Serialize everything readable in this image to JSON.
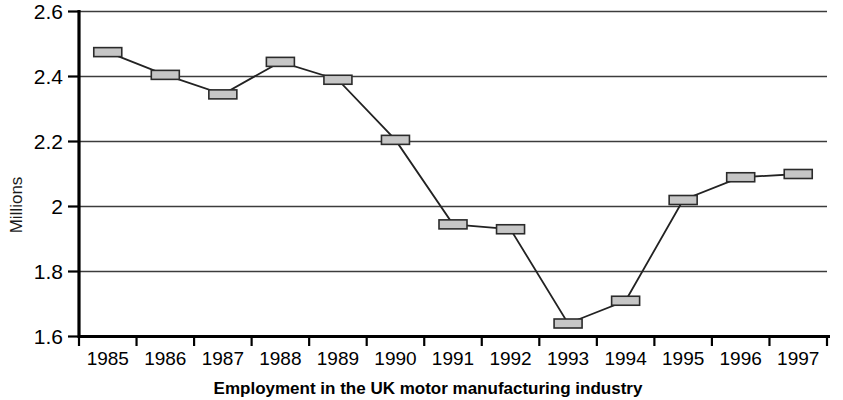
{
  "chart_data": {
    "type": "line",
    "title": "",
    "caption": "Employment in the UK motor manufacturing industry",
    "xlabel": "",
    "ylabel": "Millions",
    "categories": [
      "1985",
      "1986",
      "1987",
      "1988",
      "1989",
      "1990",
      "1991",
      "1992",
      "1993",
      "1994",
      "1995",
      "1996",
      "1997"
    ],
    "values": [
      2.475,
      2.405,
      2.345,
      2.445,
      2.39,
      2.205,
      1.945,
      1.93,
      1.64,
      1.71,
      2.02,
      2.09,
      2.1
    ],
    "series": [
      {
        "name": "Employment",
        "values": [
          2.475,
          2.405,
          2.345,
          2.445,
          2.39,
          2.205,
          1.945,
          1.93,
          1.64,
          1.71,
          2.02,
          2.09,
          2.1
        ]
      }
    ],
    "ylim": [
      1.6,
      2.6
    ],
    "ytick_labels": [
      "2.6",
      "2.4",
      "2.2",
      "2",
      "1.8",
      "1.6"
    ],
    "ytick_values": [
      2.6,
      2.4,
      2.2,
      2.0,
      1.8,
      1.6
    ],
    "grid": true,
    "grid_axis": "y",
    "legend": false,
    "legend_position": "none",
    "marker": "rectangle",
    "marker_color": "#c6c6c6",
    "line_color": "#222222"
  },
  "figure": {
    "background_color": "#ffffff",
    "axis_color": "#000000"
  }
}
